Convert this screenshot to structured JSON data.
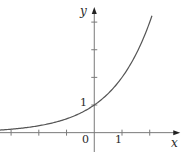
{
  "chart_data": {
    "type": "line",
    "title": "",
    "function": "y = 2^x",
    "xlabel": "x",
    "ylabel": "y",
    "xlim": [
      -3.4,
      3.2
    ],
    "ylim": [
      -0.7,
      4.8
    ],
    "x_ticks": [
      -3,
      -2,
      -1,
      1,
      2
    ],
    "y_ticks": [
      1,
      2,
      3,
      4
    ],
    "tick_labels": {
      "origin": "0",
      "x_one": "1",
      "y_one": "1"
    },
    "curve_domain": [
      -3.4,
      2.08
    ],
    "series": [
      {
        "name": "y = 2^x",
        "x": [
          -3.4,
          -3,
          -2,
          -1,
          0,
          1,
          2,
          2.08
        ],
        "y": [
          0.095,
          0.125,
          0.25,
          0.5,
          1,
          2,
          4,
          4.23
        ]
      }
    ],
    "grid": false,
    "legend": "none",
    "colors": {
      "curve": "#555555",
      "axis": "#7a7a7a",
      "text": "#2a2a2a"
    }
  }
}
